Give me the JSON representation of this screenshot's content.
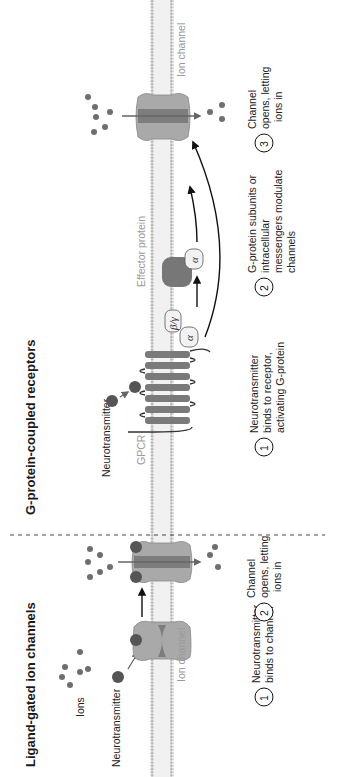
{
  "panels": {
    "left": {
      "title": "Ligand-gated ion channels",
      "labels": {
        "ions": "Ions",
        "neurotransmitter": "Neurotransmitter",
        "ion_channel": "Ion channel"
      },
      "steps": [
        {
          "number": "1",
          "line1": "Neurotransmitter",
          "line2": "binds to channel",
          "line3": ""
        },
        {
          "number": "2",
          "line1": "Channel",
          "line2": "opens, letting",
          "line3": "ions in"
        }
      ]
    },
    "right": {
      "title": "G-protein-coupled receptors",
      "labels": {
        "neurotransmitter": "Neurotransmitter",
        "gpcr": "GPCR",
        "effector_protein": "Effector protein",
        "ion_channel": "Ion channel",
        "alpha": "α",
        "beta_gamma": "β/γ"
      },
      "steps": [
        {
          "number": "1",
          "line1": "Neurotransmitter",
          "line2": "binds to receptor,",
          "line3": "activating G-protein"
        },
        {
          "number": "2",
          "line1": "G-protein subunits or",
          "line2": "intracellular",
          "line3": "messengers modulate",
          "line4": "channels"
        },
        {
          "number": "3",
          "line1": "Channel",
          "line2": "opens, letting",
          "line3": "ions in"
        }
      ]
    }
  },
  "colors": {
    "membrane_dots": "#b5b5b5",
    "membrane_fill": "#eeeeee",
    "channel_light": "#a9a9a9",
    "channel_dark": "#7d7d7d",
    "ligand": "#5a5a5a",
    "ion": "#6e6e6e",
    "gpcr": "#7a7a7a",
    "effector": "#777777",
    "subunit_fill": "#f2f2f2",
    "text": "#222222",
    "gray_text": "#9a9a9a"
  }
}
